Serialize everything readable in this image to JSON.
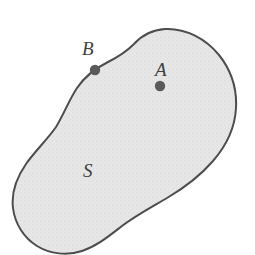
{
  "figure": {
    "caption": "",
    "type": "region-diagram",
    "background_color": "#ffffff"
  },
  "region": {
    "name": "S",
    "label": "S",
    "label_position": {
      "x": 90,
      "y": 170
    },
    "fill_color": "#e6e6e6",
    "stipple_color": "#d2d2d2",
    "stroke_color": "#4d4d4d",
    "stroke_width": 2,
    "outline_path": "M 165 29 C 186 28 206 39 219 55 C 231 70 237 89 236 108 C 235 128 226 146 213 161 C 200 176 184 188 167 198 C 150 208 135 216 122 226 C 109 236 97 246 82 251 C 67 256 50 254 37 246 C 24 238 15 224 13 208 C 11 192 17 177 26 164 C 35 151 47 140 56 127 C 64 114 69 100 77 88 C 85 76 96 68 108 62 C 118 57 126 52 134 44 C 142 35 152 30 165 29 Z",
    "boundary_extents": {
      "min_x": 13,
      "max_x": 237,
      "min_y": 28,
      "max_y": 254
    }
  },
  "points": [
    {
      "id": "A",
      "label": "A",
      "location": "interior",
      "dot": {
        "x": 160,
        "y": 86,
        "r": 5.2
      },
      "label_position": {
        "x": 163,
        "y": 69
      },
      "color": "#5a5a5a"
    },
    {
      "id": "B",
      "label": "B",
      "location": "boundary",
      "dot": {
        "x": 95,
        "y": 70,
        "r": 5.2
      },
      "label_position": {
        "x": 90,
        "y": 49
      },
      "color": "#5a5a5a"
    }
  ],
  "colors": {
    "region_fill": "#e6e6e6",
    "outline": "#4d4d4d",
    "point_marker": "#5a5a5a",
    "label_text": "#3f3f3f",
    "page_background": "#ffffff"
  }
}
